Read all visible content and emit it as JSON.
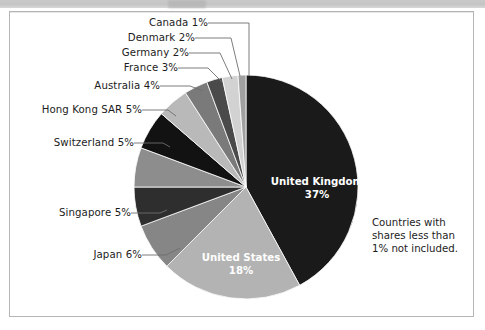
{
  "chart_data": {
    "type": "pie",
    "title": "",
    "subtitle": "",
    "xlabel": "",
    "ylabel": "",
    "legend_position": "callout-labels",
    "grid": false,
    "unit": "%",
    "start_angle_deg": 0,
    "direction": "clockwise",
    "note": "Countries with shares less than 1% not included.",
    "categories": [
      "United Kingdom",
      "United States",
      "Japan",
      "Singapore",
      "Switzerland",
      "Hong Kong SAR",
      "Australia",
      "France",
      "Germany",
      "Denmark",
      "Canada"
    ],
    "values": [
      37,
      18,
      6,
      5,
      5,
      5,
      4,
      3,
      2,
      2,
      1
    ],
    "slices": [
      {
        "label": "United Kingdom",
        "value": 37,
        "value_text": "37%",
        "color": "#1a1a1a",
        "label_placement": "inside"
      },
      {
        "label": "United States",
        "value": 18,
        "value_text": "18%",
        "color": "#b3b3b3",
        "label_placement": "inside"
      },
      {
        "label": "Japan",
        "value": 6,
        "value_text": "6%",
        "color": "#868686",
        "label_placement": "callout"
      },
      {
        "label": "Singapore",
        "value": 5,
        "value_text": "5%",
        "color": "#2e2e2e",
        "label_placement": "callout"
      },
      {
        "label": "Switzerland",
        "value": 5,
        "value_text": "5%",
        "color": "#8d8d8d",
        "label_placement": "callout"
      },
      {
        "label": "Hong Kong SAR",
        "value": 5,
        "value_text": "5%",
        "color": "#121212",
        "label_placement": "callout"
      },
      {
        "label": "Australia",
        "value": 4,
        "value_text": "4%",
        "color": "#b9b9b9",
        "label_placement": "callout"
      },
      {
        "label": "France",
        "value": 3,
        "value_text": "3%",
        "color": "#7a7a7a",
        "label_placement": "callout"
      },
      {
        "label": "Germany",
        "value": 2,
        "value_text": "2%",
        "color": "#4a4a4a",
        "label_placement": "callout"
      },
      {
        "label": "Denmark",
        "value": 2,
        "value_text": "2%",
        "color": "#d2d2d2",
        "label_placement": "callout"
      },
      {
        "label": "Canada",
        "value": 1,
        "value_text": "1%",
        "color": "#a0a0a0",
        "label_placement": "callout"
      }
    ]
  },
  "callout_labels": {
    "canada": "Canada 1%",
    "denmark": "Denmark 2%",
    "germany": "Germany 2%",
    "france": "France 3%",
    "australia": "Australia 4%",
    "hong_kong": "Hong Kong SAR 5%",
    "switzerland": "Switzerland 5%",
    "singapore": "Singapore 5%",
    "japan": "Japan 6%"
  },
  "inside_labels": {
    "uk_name": "United Kingdom",
    "uk_value": "37%",
    "us_name": "United States",
    "us_value": "18%"
  },
  "note": {
    "line1": "Countries with",
    "line2": "shares less than",
    "line3": "1% not included."
  },
  "colors": {
    "frame_border": "#b5b5b5",
    "background": "#ffffff",
    "top_band": "#c6c6c6",
    "leader_line": "#6e6e6e",
    "label_text": "#1c1c1c",
    "inside_label_text": "#ffffff"
  }
}
